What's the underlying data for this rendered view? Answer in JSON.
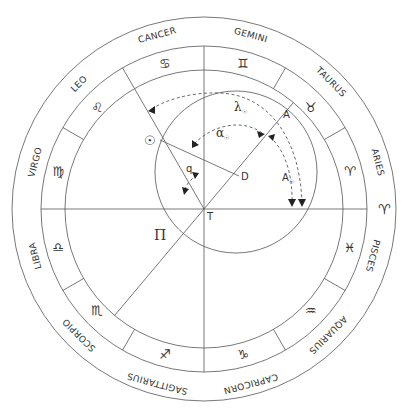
{
  "diagram": {
    "center_label": "T",
    "points": {
      "A": "A",
      "D": "D",
      "T": "T",
      "sun_symbol": "☉",
      "pole_symbol": "Π"
    },
    "angles": {
      "lambda": "λ",
      "lambda_sub": "☉",
      "alpha": "α",
      "alpha_sub": "☉",
      "A": "A",
      "A_sub": "☉",
      "q": "q"
    },
    "zodiac": [
      {
        "name": "ARIES",
        "glyph": "♈"
      },
      {
        "name": "TAURUS",
        "glyph": "♉"
      },
      {
        "name": "GEMINI",
        "glyph": "♊"
      },
      {
        "name": "CANCER",
        "glyph": "♋"
      },
      {
        "name": "LEO",
        "glyph": "♌"
      },
      {
        "name": "VIRGO",
        "glyph": "♍"
      },
      {
        "name": "LIBRA",
        "glyph": "♎"
      },
      {
        "name": "SCORPIO",
        "glyph": "♏"
      },
      {
        "name": "SAGITTARIUS",
        "glyph": "♐"
      },
      {
        "name": "CAPRICORN",
        "glyph": "♑"
      },
      {
        "name": "AQUARIUS",
        "glyph": "♒"
      },
      {
        "name": "PISCES",
        "glyph": "♓"
      }
    ],
    "vernal_point_glyph": "♈",
    "colors": {
      "line": "#555555",
      "text": "#333333",
      "background": "#ffffff"
    }
  }
}
